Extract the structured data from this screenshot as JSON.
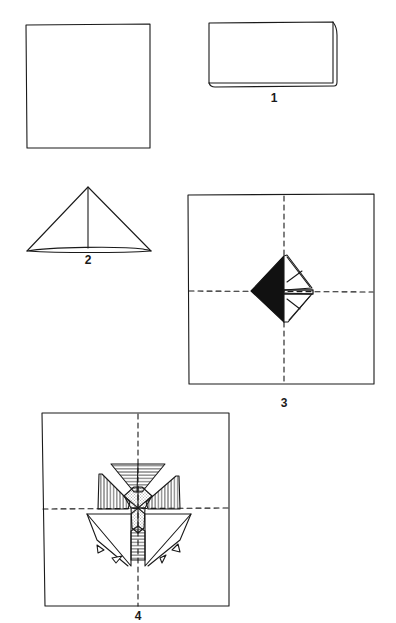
{
  "diagram": {
    "type": "origami-folding-instructions",
    "ink_color": "#1a1a1a",
    "paper_color": "#ffffff",
    "steps": [
      {
        "id": "start",
        "label": "",
        "shape": "square sheet",
        "bbox": [
          26,
          25,
          150,
          148
        ]
      },
      {
        "id": "step-1",
        "label": "1",
        "shape": "rectangle (folded in half)",
        "bbox": [
          209,
          22,
          335,
          86
        ],
        "label_pos": [
          274,
          93
        ]
      },
      {
        "id": "step-2",
        "label": "2",
        "shape": "triangle with center crease",
        "bbox": [
          27,
          186,
          151,
          253
        ],
        "label_pos": [
          88,
          254
        ]
      },
      {
        "id": "step-3",
        "label": "3",
        "shape": "square with dashed crease lines and folded diamond, left half filled black",
        "bbox": [
          188,
          195,
          374,
          384
        ],
        "label_pos": [
          284,
          397
        ]
      },
      {
        "id": "step-4",
        "label": "4",
        "shape": "square with dashed crease lines and finished four-point star/pinwheel with hatched and dotted flaps",
        "bbox": [
          42,
          413,
          229,
          606
        ],
        "label_pos": [
          138,
          610
        ]
      }
    ]
  }
}
